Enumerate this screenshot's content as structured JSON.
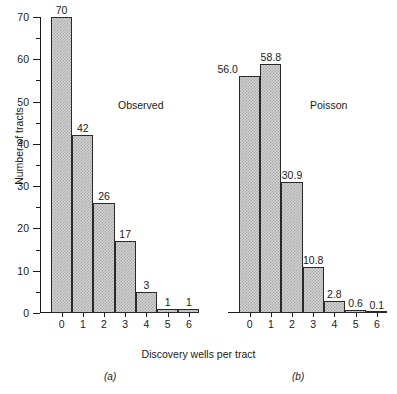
{
  "axes": {
    "ylabel": "Number of tracts",
    "xlabel": "Discovery wells per tract",
    "yticks": [
      0,
      10,
      20,
      30,
      40,
      50,
      60,
      70
    ],
    "yminor": [
      5,
      15,
      25,
      35,
      45,
      55,
      65
    ],
    "ylim": [
      0,
      70
    ],
    "xticklabels": [
      "0",
      "1",
      "2",
      "3",
      "4",
      "5",
      "6"
    ]
  },
  "panels": [
    {
      "key": "a",
      "caption": "(a)",
      "annotation": "Observed"
    },
    {
      "key": "b",
      "caption": "(b)",
      "annotation": "Poisson"
    }
  ],
  "chart_data": [
    {
      "type": "bar",
      "title": "Observed",
      "caption": "(a)",
      "xlabel": "Discovery wells per tract",
      "ylabel": "Number of tracts",
      "categories": [
        "0",
        "1",
        "2",
        "3",
        "4",
        "5",
        "6"
      ],
      "values": [
        70,
        42,
        26,
        17,
        5,
        1,
        1
      ],
      "data_labels": [
        "70",
        "42",
        "26",
        "17",
        "3",
        "1",
        "1"
      ],
      "ylim": [
        0,
        70
      ],
      "grid": false,
      "legend": "none"
    },
    {
      "type": "bar",
      "title": "Poisson",
      "caption": "(b)",
      "xlabel": "Discovery wells per tract",
      "ylabel": "Number of tracts",
      "categories": [
        "0",
        "1",
        "2",
        "3",
        "4",
        "5",
        "6"
      ],
      "values": [
        56.0,
        58.8,
        30.9,
        10.8,
        2.8,
        0.6,
        0.1
      ],
      "data_labels": [
        "56.0",
        "58.8",
        "30.9",
        "10.8",
        "2.8",
        "0.6",
        "0.1"
      ],
      "ylim": [
        0,
        70
      ],
      "grid": false,
      "legend": "none"
    }
  ],
  "style": {
    "bar_fill": "#d2d2d2",
    "bar_pattern": "#a9a9a9",
    "bar_stroke": "#2a2a2a",
    "axis_color": "#1a1a1a",
    "background": "#ffffff"
  }
}
